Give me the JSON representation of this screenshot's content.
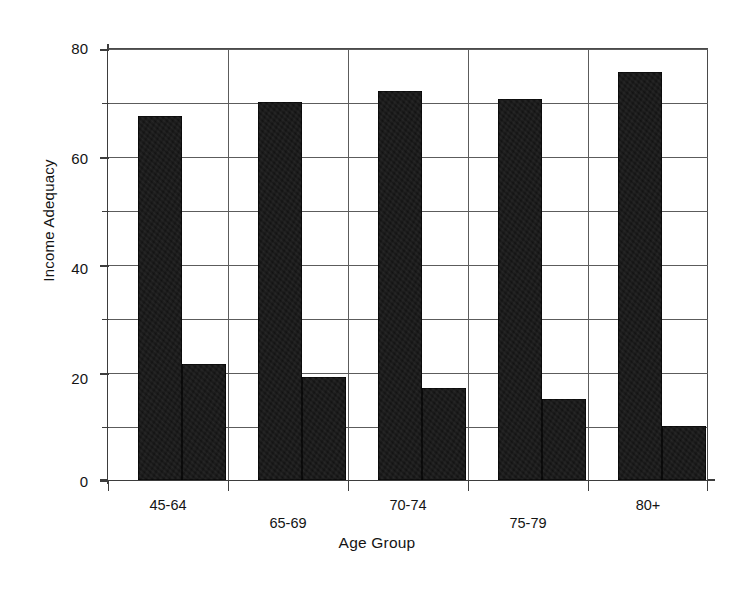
{
  "chart_data": {
    "type": "bar",
    "title": "",
    "subtitle": "",
    "xlabel": "Age Group",
    "ylabel": "Income Adequacy",
    "categories": [
      "45-64",
      "65-69",
      "70-74",
      "75-79",
      "80+"
    ],
    "series": [
      {
        "name": "series-1",
        "values": [
          67.5,
          70,
          72,
          70.5,
          75.5
        ]
      },
      {
        "name": "series-2",
        "values": [
          21.5,
          19,
          17,
          15,
          10
        ]
      }
    ],
    "ylim": [
      0,
      80
    ],
    "xlim": [
      0,
      5
    ],
    "y_major_ticks": [
      0,
      20,
      40,
      60,
      80
    ],
    "y_minor_ticks": [
      10,
      30,
      50,
      70
    ],
    "y_tick_labels": [
      "0",
      "20",
      "40",
      "60",
      "80"
    ],
    "gridlines_horizontal": [
      10,
      20,
      30,
      40,
      50,
      60,
      70,
      80
    ],
    "gridlines_vertical": [
      1,
      2,
      3,
      4
    ],
    "grid": true,
    "legend": false,
    "legend_position": "none",
    "bar_color": "#121212",
    "grid_color": "#5c5c5c",
    "axis_color": "#3d3d3d",
    "text_color": "#141414",
    "background": "#ffffff",
    "x_label_stagger": true,
    "annotations": []
  }
}
